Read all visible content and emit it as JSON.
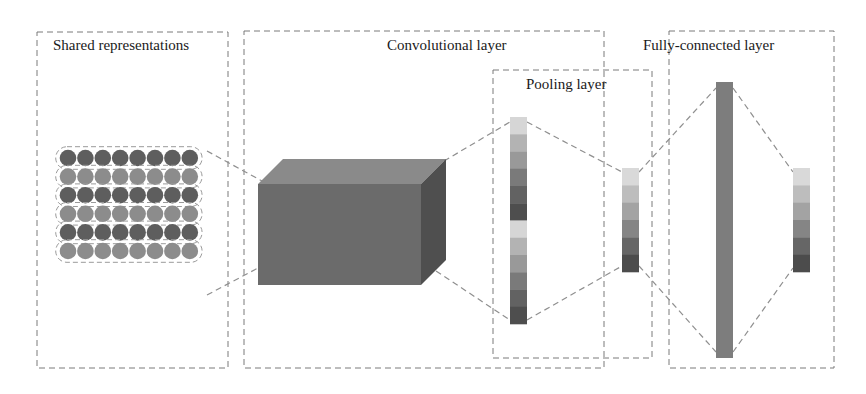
{
  "figure": {
    "type": "neural-network-architecture",
    "panels": [
      {
        "id": "shared",
        "label": "Shared representations"
      },
      {
        "id": "conv",
        "label": "Convolutional layer"
      },
      {
        "id": "pooling",
        "label": "Pooling layer"
      },
      {
        "id": "fc",
        "label": "Fully-connected layer"
      }
    ],
    "shared_representations": {
      "rows": 6,
      "circles_per_row": 8,
      "row_colors": [
        "#5e5e5e",
        "#8c8c8c",
        "#5e5e5e",
        "#8c8c8c",
        "#5e5e5e",
        "#8c8c8c"
      ]
    },
    "conv_bar_segments": [
      "#d6d6d6",
      "#b3b3b3",
      "#999999",
      "#7a7a7a",
      "#626262",
      "#4e4e4e",
      "#d6d6d6",
      "#b3b3b3",
      "#999999",
      "#7a7a7a",
      "#626262",
      "#4e4e4e"
    ],
    "pool_bar_segments": [
      "#d9d9d9",
      "#bdbdbd",
      "#a3a3a3",
      "#858585",
      "#666666",
      "#4c4c4c"
    ],
    "output_bar_segments": [
      "#d9d9d9",
      "#bdbdbd",
      "#a3a3a3",
      "#858585",
      "#666666",
      "#4c4c4c"
    ],
    "colors": {
      "cube_front": "#6b6b6b",
      "cube_top": "#8a8a8a",
      "cube_side": "#4f4f4f",
      "fc_bar": "#7d7d7d",
      "dashed_line": "#8f8f8f",
      "border": "#7a7a7a"
    }
  }
}
